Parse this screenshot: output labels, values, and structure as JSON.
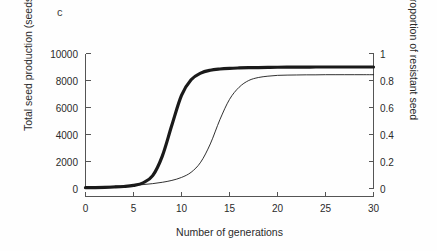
{
  "figure": {
    "panel_label": "c",
    "background_color": "#fefefe",
    "line_color": "#1a1a1a",
    "axis_color": "#555555"
  },
  "chart_data": {
    "type": "line",
    "title": "",
    "xlabel": "Number of generations",
    "ylabel": "Total seed production (seeds m",
    "ylabel_exponent": "-2",
    "ylabel_suffix": ")",
    "y2label": "Proportion of resistant seed",
    "xlim": [
      0,
      30
    ],
    "ylim": [
      0,
      10000
    ],
    "y2lim": [
      0,
      1
    ],
    "grid": false,
    "legend": "none",
    "xticks": [
      0,
      5,
      10,
      15,
      20,
      25,
      30
    ],
    "xtick_labels": [
      "0",
      "5",
      "10",
      "15",
      "20",
      "25",
      "30"
    ],
    "yticks": [
      0,
      2000,
      4000,
      6000,
      8000,
      10000
    ],
    "ytick_labels": [
      "0",
      "2000",
      "4000",
      "6000",
      "8000",
      "10000"
    ],
    "y2ticks": [
      0,
      0.2,
      0.4,
      0.6,
      0.8,
      1
    ],
    "y2tick_labels": [
      "0",
      "0.2",
      "0.4",
      "0.6",
      "0.8",
      "1"
    ],
    "x": [
      0,
      1,
      2,
      3,
      4,
      5,
      6,
      7,
      8,
      9,
      10,
      11,
      12,
      13,
      14,
      15,
      16,
      17,
      18,
      19,
      20,
      21,
      22,
      23,
      24,
      25,
      26,
      27,
      28,
      29,
      30
    ],
    "series": [
      {
        "name": "Total seed production",
        "axis": "left",
        "line_width": 3.2,
        "values": [
          60,
          70,
          85,
          110,
          150,
          230,
          420,
          950,
          2400,
          4700,
          6900,
          8050,
          8550,
          8760,
          8850,
          8900,
          8930,
          8950,
          8960,
          8970,
          8980,
          8985,
          8990,
          8995,
          9000,
          9000,
          9000,
          9000,
          9000,
          9000,
          9000
        ]
      },
      {
        "name": "Proportion of resistant seed",
        "axis": "right",
        "line_width": 0.9,
        "values": [
          0.012,
          0.013,
          0.015,
          0.017,
          0.02,
          0.024,
          0.029,
          0.036,
          0.046,
          0.06,
          0.082,
          0.12,
          0.195,
          0.33,
          0.51,
          0.66,
          0.75,
          0.8,
          0.822,
          0.832,
          0.838,
          0.84,
          0.841,
          0.842,
          0.842,
          0.843,
          0.843,
          0.843,
          0.843,
          0.843,
          0.843
        ]
      }
    ]
  }
}
